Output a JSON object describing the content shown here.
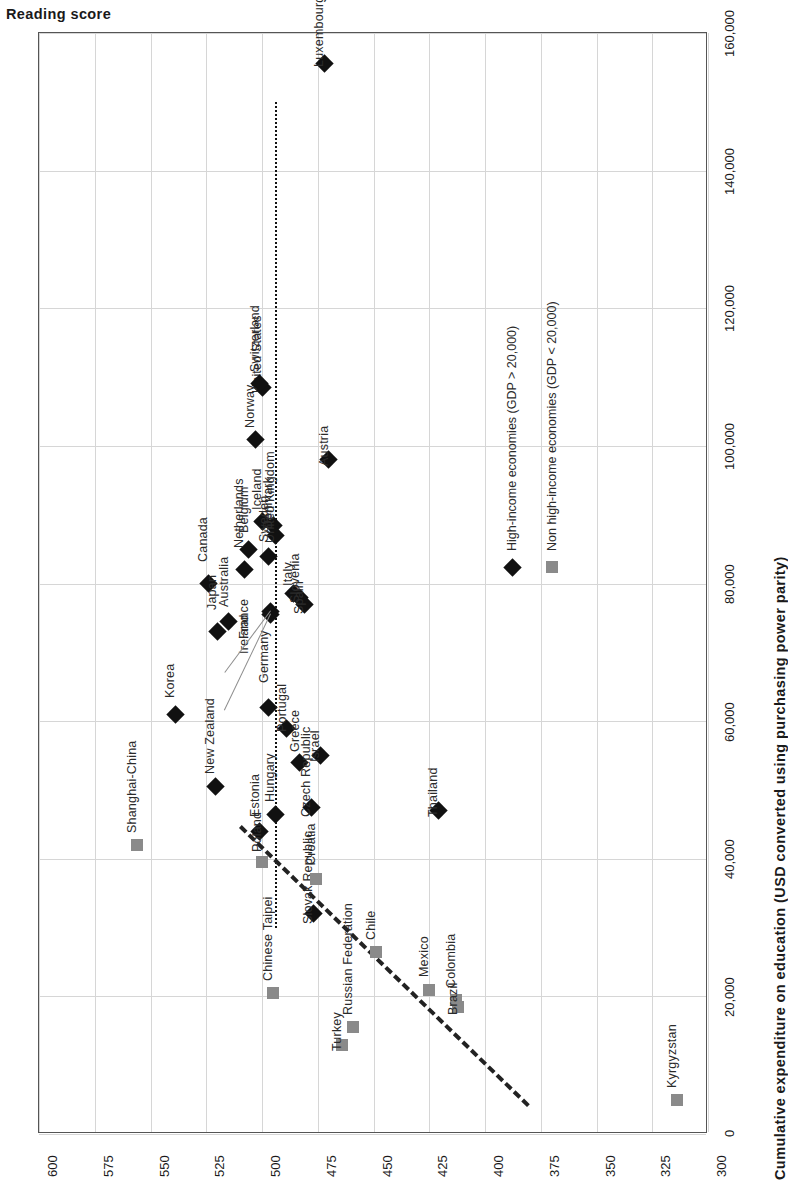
{
  "chart_data": {
    "type": "scatter",
    "title": "",
    "orientation": "rotated-90ccw",
    "ylabel": "Reading score",
    "xlabel": "Cumulative expenditure on education (USD converted using purchasing power parity)",
    "ylim": [
      300,
      600
    ],
    "xlim": [
      0,
      160000
    ],
    "yticks": [
      600,
      575,
      550,
      525,
      500,
      475,
      450,
      425,
      400,
      375,
      350,
      325,
      300
    ],
    "ytick_labels": [
      "600",
      "575",
      "550",
      "525",
      "500",
      "475",
      "450",
      "425",
      "400",
      "375",
      "350",
      "325",
      "300"
    ],
    "xticks": [
      0,
      20000,
      40000,
      60000,
      80000,
      100000,
      120000,
      140000,
      160000
    ],
    "xtick_labels": [
      "0",
      "20,000",
      "40,000",
      "60,000",
      "80,000",
      "100,000",
      "120,000",
      "140,000",
      "160,000"
    ],
    "grid": true,
    "legend_position": "right-middle",
    "series": [
      {
        "name": "High-income economies (GDP > 20,000)",
        "marker": "diamond",
        "color": "#111111",
        "points": [
          {
            "label": "Luxembourg",
            "x": 155600,
            "y": 472
          },
          {
            "label": "United States",
            "x": 108500,
            "y": 500
          },
          {
            "label": "Switzerland",
            "x": 109000,
            "y": 501
          },
          {
            "label": "Norway",
            "x": 100900,
            "y": 503
          },
          {
            "label": "Austria",
            "x": 98000,
            "y": 470
          },
          {
            "label": "Iceland",
            "x": 89000,
            "y": 500
          },
          {
            "label": "Denmark",
            "x": 88500,
            "y": 495
          },
          {
            "label": "United Kingdom",
            "x": 87000,
            "y": 494
          },
          {
            "label": "Belgium",
            "x": 85000,
            "y": 506
          },
          {
            "label": "Sweden",
            "x": 84000,
            "y": 497
          },
          {
            "label": "Netherlands",
            "x": 82000,
            "y": 508
          },
          {
            "label": "Canada",
            "x": 80000,
            "y": 524
          },
          {
            "label": "Italy",
            "x": 78500,
            "y": 486
          },
          {
            "label": "Slovenia",
            "x": 78000,
            "y": 483
          },
          {
            "label": "Spain",
            "x": 77000,
            "y": 481
          },
          {
            "label": "France",
            "x": 76000,
            "y": 496
          },
          {
            "label": "Ireland",
            "x": 75500,
            "y": 496
          },
          {
            "label": "Australia",
            "x": 74500,
            "y": 515
          },
          {
            "label": "Japan",
            "x": 73000,
            "y": 520
          },
          {
            "label": "Korea",
            "x": 61000,
            "y": 539
          },
          {
            "label": "Germany",
            "x": 62000,
            "y": 497
          },
          {
            "label": "Portugal",
            "x": 59000,
            "y": 489
          },
          {
            "label": "Israel",
            "x": 55000,
            "y": 474
          },
          {
            "label": "Greece",
            "x": 54000,
            "y": 483
          },
          {
            "label": "New Zealand",
            "x": 50500,
            "y": 521
          },
          {
            "label": "Thailand",
            "x": 47000,
            "y": 421
          },
          {
            "label": "Czech Republic",
            "x": 47500,
            "y": 478
          },
          {
            "label": "Hungary",
            "x": 46500,
            "y": 494
          },
          {
            "label": "Estonia",
            "x": 44000,
            "y": 501
          },
          {
            "label": "Slovak Republic",
            "x": 32000,
            "y": 477
          }
        ]
      },
      {
        "name": "Non high-income economies (GDP < 20,000)",
        "marker": "square",
        "color": "#8a8a8a",
        "points": [
          {
            "label": "Shanghai-China",
            "x": 42000,
            "y": 556
          },
          {
            "label": "Chinese Taipei",
            "x": 20500,
            "y": 495
          },
          {
            "label": "Croatia",
            "x": 37000,
            "y": 476
          },
          {
            "label": "Poland",
            "x": 39500,
            "y": 500
          },
          {
            "label": "Chile",
            "x": 26500,
            "y": 449
          },
          {
            "label": "Russian Federation",
            "x": 15500,
            "y": 459
          },
          {
            "label": "Turkey",
            "x": 13000,
            "y": 464
          },
          {
            "label": "Mexico",
            "x": 21000,
            "y": 425
          },
          {
            "label": "Colombia",
            "x": 19500,
            "y": 413
          },
          {
            "label": "Brazil",
            "x": 18500,
            "y": 412
          },
          {
            "label": "Kyrgyzstan",
            "x": 5000,
            "y": 314
          }
        ]
      }
    ],
    "annotations": {
      "oecd_reference_line": {
        "kind": "dotted-vertical",
        "reading_score": 494
      },
      "trend_line": {
        "kind": "dashed",
        "from": {
          "x": 4000,
          "y": 381
        },
        "to": {
          "x": 44500,
          "y": 510
        }
      }
    }
  },
  "legend": {
    "items": [
      {
        "key": "diamond-marker",
        "label": "High-income economies (GDP > 20,000)"
      },
      {
        "key": "square-marker",
        "label": "Non high-income economies (GDP < 20,000)"
      }
    ]
  },
  "axes": {
    "y_title": "Reading score",
    "x_title": "Cumulative expenditure on education (USD converted using purchasing power parity)"
  }
}
